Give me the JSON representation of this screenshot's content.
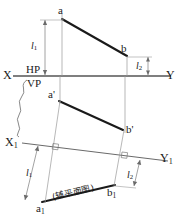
{
  "figure": {
    "type": "descriptive-geometry-projection-drawing",
    "background_color": "#ffffff",
    "ink_color": "#1a1a1a",
    "thin_line_color": "#8a8a8a"
  },
  "labels": {
    "point_a": "a",
    "point_b": "b",
    "point_a_prime": "a'",
    "point_b_prime": "b'",
    "point_a1": "a",
    "point_a1_sub": "1",
    "point_b1": "b",
    "point_b1_sub": "1",
    "axis_x": "X",
    "axis_y": "Y",
    "axis_x1": "X",
    "axis_x1_sub": "1",
    "axis_y1": "Y",
    "axis_y1_sub": "1",
    "plane_hp": "HP",
    "plane_vp": "VP",
    "dim_l1_top": "l",
    "dim_l1_top_sub": "1",
    "dim_l2_top": "l",
    "dim_l2_top_sub": "2",
    "dim_l1_aux": "l",
    "dim_l1_aux_sub": "1",
    "dim_l2_aux": "l",
    "dim_l2_aux_sub": "2",
    "view_caption": "(辅平面图)"
  },
  "geometry": {
    "points": {
      "a": {
        "x": 62,
        "y": 19
      },
      "b": {
        "x": 127,
        "y": 56
      },
      "a_prime": {
        "x": 59,
        "y": 101
      },
      "b_prime": {
        "x": 123,
        "y": 130
      },
      "a1": {
        "x": 42,
        "y": 202
      },
      "b1": {
        "x": 115,
        "y": 185
      }
    },
    "axis_xy": {
      "x1": 13,
      "y1": 76,
      "x2": 171,
      "y2": 76
    },
    "axis_x1y1": {
      "x1": 22,
      "y1": 143,
      "x2": 168,
      "y2": 161
    },
    "dimensions": {
      "l1_top": {
        "from_y": 19,
        "to_y": 76,
        "at_x": 36
      },
      "l2_top": {
        "from_y": 56,
        "to_y": 76,
        "at_x": 144
      },
      "l1_aux": {
        "label_x": 29,
        "label_y": 172
      },
      "l2_aux": {
        "label_x": 131,
        "label_y": 175
      }
    }
  }
}
